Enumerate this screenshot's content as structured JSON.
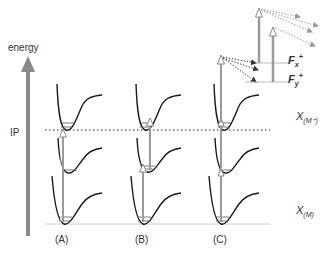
{
  "axis": {
    "label": "energy",
    "ip_label": "IP",
    "arrow_color": "#8a8a8a"
  },
  "panels": [
    {
      "id": "A",
      "label": "(A)"
    },
    {
      "id": "B",
      "label": "(B)"
    },
    {
      "id": "C",
      "label": "(C)"
    }
  ],
  "states": {
    "cation": {
      "main": "X",
      "sub": "(M⁺)"
    },
    "neutral": {
      "main": "X",
      "sub": "(M)"
    }
  },
  "fragments": [
    {
      "main": "F",
      "sub": "x",
      "sup": "+"
    },
    {
      "main": "F",
      "sub": "y",
      "sup": "+"
    }
  ],
  "colors": {
    "curve": "#1a1a1a",
    "arrow": "#9a9a9a",
    "dotted": "#333333",
    "baseline": "#cccccc"
  }
}
